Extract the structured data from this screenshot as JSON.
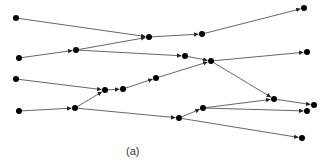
{
  "diagram": {
    "caption": "(a)",
    "node_color": "#000000",
    "edge_color": "#555555",
    "nodes": [
      {
        "id": "n1",
        "x": 16,
        "y": 18
      },
      {
        "id": "n2",
        "x": 19,
        "y": 58
      },
      {
        "id": "n3",
        "x": 76,
        "y": 50
      },
      {
        "id": "n4",
        "x": 149,
        "y": 37
      },
      {
        "id": "n5",
        "x": 202,
        "y": 34
      },
      {
        "id": "n6",
        "x": 304,
        "y": 8
      },
      {
        "id": "n7",
        "x": 185,
        "y": 56
      },
      {
        "id": "n8",
        "x": 211,
        "y": 61
      },
      {
        "id": "n9",
        "x": 307,
        "y": 52
      },
      {
        "id": "n10",
        "x": 16,
        "y": 79
      },
      {
        "id": "n11",
        "x": 105,
        "y": 90
      },
      {
        "id": "n12",
        "x": 123,
        "y": 89
      },
      {
        "id": "n13",
        "x": 156,
        "y": 78
      },
      {
        "id": "n14",
        "x": 19,
        "y": 111
      },
      {
        "id": "n15",
        "x": 75,
        "y": 108
      },
      {
        "id": "n16",
        "x": 274,
        "y": 99
      },
      {
        "id": "n17",
        "x": 314,
        "y": 105
      },
      {
        "id": "n18",
        "x": 203,
        "y": 108
      },
      {
        "id": "n19",
        "x": 307,
        "y": 111
      },
      {
        "id": "n20",
        "x": 179,
        "y": 118
      },
      {
        "id": "n21",
        "x": 302,
        "y": 138
      }
    ],
    "edges": [
      [
        "n1",
        "n4"
      ],
      [
        "n2",
        "n3"
      ],
      [
        "n3",
        "n4"
      ],
      [
        "n4",
        "n5"
      ],
      [
        "n5",
        "n6"
      ],
      [
        "n3",
        "n7"
      ],
      [
        "n7",
        "n8"
      ],
      [
        "n13",
        "n8"
      ],
      [
        "n8",
        "n9"
      ],
      [
        "n8",
        "n16"
      ],
      [
        "n10",
        "n11"
      ],
      [
        "n11",
        "n12"
      ],
      [
        "n12",
        "n13"
      ],
      [
        "n14",
        "n15"
      ],
      [
        "n15",
        "n11"
      ],
      [
        "n15",
        "n20"
      ],
      [
        "n20",
        "n18"
      ],
      [
        "n18",
        "n16"
      ],
      [
        "n16",
        "n17"
      ],
      [
        "n18",
        "n19"
      ],
      [
        "n20",
        "n21"
      ]
    ]
  }
}
